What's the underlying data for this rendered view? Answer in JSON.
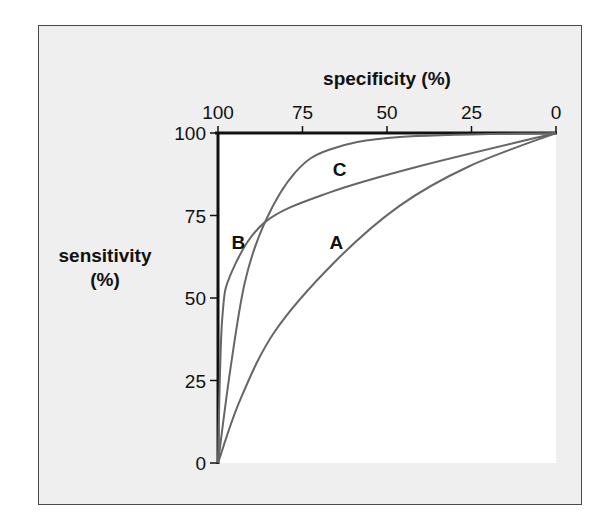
{
  "chart_data": {
    "type": "line",
    "title": "",
    "xlabel": "specificity (%)",
    "ylabel_line1": "sensitivity",
    "ylabel_line2": "(%)",
    "x_axis_position": "top",
    "x_axis_reversed": true,
    "xlim": [
      100,
      0
    ],
    "ylim": [
      0,
      100
    ],
    "x_ticks": [
      "100",
      "75",
      "50",
      "25",
      "0"
    ],
    "x_tick_values": [
      100,
      75,
      50,
      25,
      0
    ],
    "y_ticks": [
      "100",
      "75",
      "50",
      "25",
      "0"
    ],
    "y_tick_values": [
      100,
      75,
      50,
      25,
      0
    ],
    "grid": false,
    "legend": "inline curve labels",
    "series": [
      {
        "name": "A",
        "specificity": [
          100,
          93.5,
          83.1,
          65.4,
          46.2,
          25.5,
          0
        ],
        "sensitivity": [
          0,
          19,
          40,
          61,
          78,
          90,
          100
        ],
        "label_position": {
          "specificity": 65,
          "sensitivity": 67
        }
      },
      {
        "name": "B",
        "specificity": [
          100,
          98.8,
          95.9,
          86.1,
          66.9,
          40.2,
          0
        ],
        "sensitivity": [
          0,
          43,
          58,
          73,
          82,
          90,
          100
        ],
        "label_position": {
          "specificity": 94,
          "sensitivity": 67
        }
      },
      {
        "name": "C",
        "specificity": [
          100,
          96.4,
          92,
          86.1,
          77.2,
          66.9,
          46.2,
          0
        ],
        "sensitivity": [
          0,
          28,
          55,
          73,
          88,
          95,
          98.8,
          100
        ],
        "label_position": {
          "specificity": 64,
          "sensitivity": 89
        }
      }
    ]
  },
  "colors": {
    "frame_bg": "#efefef",
    "plot_bg": "#ffffff",
    "axis": "#111111",
    "curve": "#666666"
  }
}
